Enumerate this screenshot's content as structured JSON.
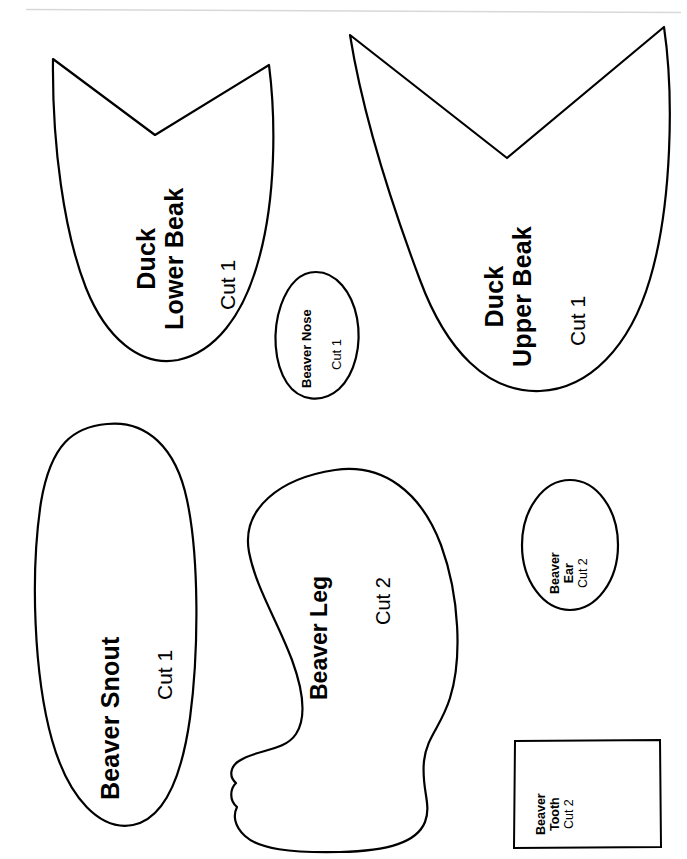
{
  "sheet": {
    "title": "Craft Pattern Template Sheet",
    "background_color": "#ffffff",
    "ink_color": "#000000",
    "rule_color": "#d8d8da",
    "width": 687,
    "height": 859
  },
  "pieces": [
    {
      "id": "duck-lower-beak",
      "shape": "beak",
      "name_line1": "Duck",
      "name_line2": "Lower Beak",
      "cut": "Cut 1"
    },
    {
      "id": "duck-upper-beak",
      "shape": "beak",
      "name_line1": "Duck",
      "name_line2": "Upper Beak",
      "cut": "Cut 1"
    },
    {
      "id": "beaver-nose",
      "shape": "oval",
      "name_line1": "Beaver Nose",
      "name_line2": "",
      "cut": "Cut 1"
    },
    {
      "id": "beaver-snout",
      "shape": "long-oval",
      "name_line1": "Beaver Snout",
      "name_line2": "",
      "cut": "Cut 1"
    },
    {
      "id": "beaver-leg",
      "shape": "leg",
      "name_line1": "Beaver Leg",
      "name_line2": "",
      "cut": "Cut 2"
    },
    {
      "id": "beaver-ear",
      "shape": "oval",
      "name_line1": "Beaver",
      "name_line2": "Ear",
      "cut": "Cut 2"
    },
    {
      "id": "beaver-tooth",
      "shape": "rectangle",
      "name_line1": "Beaver",
      "name_line2": "Tooth",
      "cut": "Cut 2"
    }
  ],
  "labels": {
    "duck_lower_beak": {
      "l1": "Duck",
      "l2": "Lower Beak",
      "cut": "Cut 1"
    },
    "duck_upper_beak": {
      "l1": "Duck",
      "l2": "Upper Beak",
      "cut": "Cut 1"
    },
    "beaver_nose": {
      "l1": "Beaver Nose",
      "cut": "Cut 1"
    },
    "beaver_snout": {
      "l1": "Beaver Snout",
      "cut": "Cut 1"
    },
    "beaver_leg": {
      "l1": "Beaver Leg",
      "cut": "Cut 2"
    },
    "beaver_ear": {
      "l1": "Beaver",
      "l2": "Ear",
      "cut": "Cut 2"
    },
    "beaver_tooth": {
      "l1": "Beaver",
      "l2": "Tooth",
      "cut": "Cut 2"
    }
  }
}
